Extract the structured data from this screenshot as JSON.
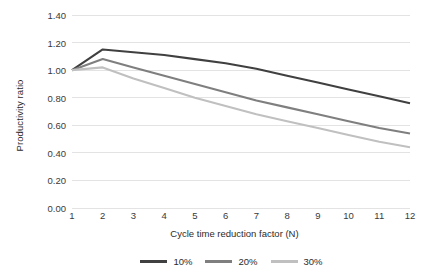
{
  "chart_data": {
    "type": "line",
    "title": "",
    "xlabel": "Cycle time reduction factor (N)",
    "ylabel": "Productivity ratio",
    "xlim": [
      1,
      12
    ],
    "ylim": [
      0.0,
      1.4
    ],
    "grid": true,
    "legend_position": "bottom",
    "x": [
      1,
      2,
      3,
      4,
      5,
      6,
      7,
      8,
      9,
      10,
      11,
      12
    ],
    "xticklabels": [
      "1",
      "2",
      "3",
      "4",
      "5",
      "6",
      "7",
      "8",
      "9",
      "10",
      "11",
      "12"
    ],
    "yticklabels": [
      "0.00",
      "0.20",
      "0.40",
      "0.60",
      "0.80",
      "1.00",
      "1.20",
      "1.40"
    ],
    "yticks": [
      0.0,
      0.2,
      0.4,
      0.6,
      0.8,
      1.0,
      1.2,
      1.4
    ],
    "series": [
      {
        "name": "10%",
        "color": "#404040",
        "values": [
          1.0,
          1.15,
          1.13,
          1.11,
          1.08,
          1.05,
          1.01,
          0.96,
          0.91,
          0.86,
          0.81,
          0.76
        ]
      },
      {
        "name": "20%",
        "color": "#7f7f7f",
        "values": [
          1.0,
          1.08,
          1.02,
          0.96,
          0.9,
          0.84,
          0.78,
          0.73,
          0.68,
          0.63,
          0.58,
          0.54
        ]
      },
      {
        "name": "30%",
        "color": "#c0c0c0",
        "values": [
          1.0,
          1.02,
          0.94,
          0.87,
          0.8,
          0.74,
          0.68,
          0.63,
          0.58,
          0.53,
          0.48,
          0.44
        ]
      }
    ]
  },
  "legend": {
    "items": [
      {
        "label": "10%",
        "color": "#404040"
      },
      {
        "label": "20%",
        "color": "#7f7f7f"
      },
      {
        "label": "30%",
        "color": "#c0c0c0"
      }
    ]
  },
  "colors": {
    "gridline": "#e3e3e3",
    "tick_text": "#3a3a3a",
    "axis_title": "#2b2b2b",
    "background": "#ffffff"
  }
}
